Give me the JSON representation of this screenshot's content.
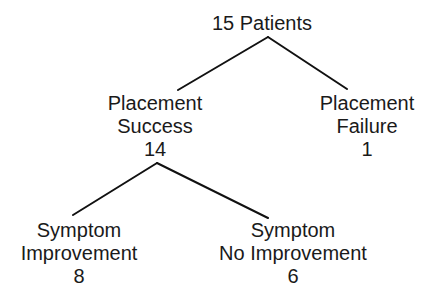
{
  "diagram": {
    "type": "tree",
    "colors": {
      "line": "#111111",
      "text": "#1a1a1a",
      "background": "#ffffff"
    },
    "nodes": {
      "root": {
        "label": "15 Patients"
      },
      "placement_success": {
        "line1": "Placement",
        "line2": "Success",
        "count": "14"
      },
      "placement_failure": {
        "line1": "Placement",
        "line2": "Failure",
        "count": "1"
      },
      "symptom_improvement": {
        "line1": "Symptom",
        "line2": "Improvement",
        "count": "8"
      },
      "symptom_no_improvement": {
        "line1": "Symptom",
        "line2": "No Improvement",
        "count": "6"
      }
    },
    "edges": [
      {
        "from": "root",
        "to": "placement_success"
      },
      {
        "from": "root",
        "to": "placement_failure"
      },
      {
        "from": "placement_success",
        "to": "symptom_improvement"
      },
      {
        "from": "placement_success",
        "to": "symptom_no_improvement"
      }
    ]
  }
}
